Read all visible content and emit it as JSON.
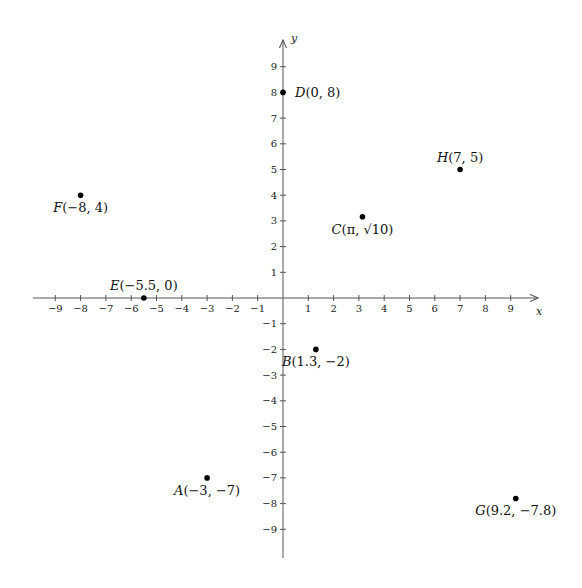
{
  "chart_data": {
    "type": "scatter",
    "title": "",
    "xlabel": "x",
    "ylabel": "y",
    "xlim": [
      -9.9,
      10
    ],
    "ylim": [
      -10.2,
      9.9
    ],
    "grid": false,
    "legend": null,
    "x_ticks": [
      -9,
      -8,
      -7,
      -6,
      -5,
      -4,
      -3,
      -2,
      -1,
      1,
      2,
      3,
      4,
      5,
      6,
      7,
      8,
      9
    ],
    "y_ticks": [
      -9,
      -8,
      -7,
      -6,
      -5,
      -4,
      -3,
      -2,
      -1,
      1,
      2,
      3,
      4,
      5,
      6,
      7,
      8,
      9
    ],
    "points": [
      {
        "name": "A",
        "x": -3,
        "y": -7,
        "label": "A(−3, −7)",
        "label_pos": "below"
      },
      {
        "name": "B",
        "x": 1.3,
        "y": -2,
        "label": "B(1.3, −2)",
        "label_pos": "below"
      },
      {
        "name": "C",
        "x": 3.14159,
        "y": 3.16228,
        "label": "C(π, √10)",
        "label_pos": "below"
      },
      {
        "name": "D",
        "x": 0,
        "y": 8,
        "label": "D(0, 8)",
        "label_pos": "right"
      },
      {
        "name": "E",
        "x": -5.5,
        "y": 0,
        "label": "E(−5.5, 0)",
        "label_pos": "above"
      },
      {
        "name": "F",
        "x": -8,
        "y": 4,
        "label": "F(−8, 4)",
        "label_pos": "below"
      },
      {
        "name": "G",
        "x": 9.2,
        "y": -7.8,
        "label": "G(9.2, −7.8)",
        "label_pos": "below"
      },
      {
        "name": "H",
        "x": 7,
        "y": 5,
        "label": "H(7, 5)",
        "label_pos": "above"
      }
    ]
  },
  "layout": {
    "origin_px": [
      283,
      298
    ],
    "unit_x_px": 25.3,
    "unit_y_px": 25.7,
    "x_axis_px": [
      33,
      538
    ],
    "y_axis_px": [
      558,
      40
    ],
    "colors": {
      "axis": "#555555",
      "point": "#000000",
      "text": "#111111"
    }
  }
}
